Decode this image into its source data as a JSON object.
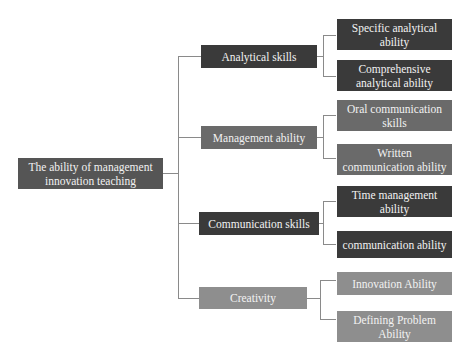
{
  "diagram": {
    "type": "tree",
    "root": {
      "label": "The ability of management innovation teaching"
    },
    "branches": [
      {
        "label": "Analytical skills",
        "shade": "dark",
        "children": [
          {
            "label": "Specific analytical ability",
            "shade": "dark"
          },
          {
            "label": "Comprehensive analytical ability",
            "shade": "dark"
          }
        ]
      },
      {
        "label": "Management ability",
        "shade": "mid",
        "children": [
          {
            "label": "Oral communication skills",
            "shade": "mid"
          },
          {
            "label": "Written communication ability",
            "shade": "mid"
          }
        ]
      },
      {
        "label": "Communication skills",
        "shade": "dark",
        "children": [
          {
            "label": "Time management ability",
            "shade": "dark"
          },
          {
            "label": "communication ability",
            "shade": "dark"
          }
        ]
      },
      {
        "label": "Creativity",
        "shade": "light",
        "children": [
          {
            "label": "Innovation Ability",
            "shade": "light"
          },
          {
            "label": "Defining Problem Ability",
            "shade": "light"
          }
        ]
      }
    ]
  },
  "colors": {
    "dark": "#3a3a3a",
    "mid": "#6a6a6a",
    "light": "#8e8e8e",
    "root": "#555555",
    "connector": "#8a8a8a",
    "text": "#f2f2f2"
  }
}
